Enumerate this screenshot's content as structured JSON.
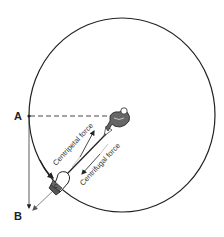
{
  "diagram": {
    "type": "physics-diagram",
    "points": [
      {
        "id": "A",
        "label": "A"
      },
      {
        "id": "B",
        "label": "B"
      }
    ],
    "forces": [
      {
        "id": "centripetal",
        "label": "Centripetal force",
        "direction": "toward-center"
      },
      {
        "id": "centrifugal",
        "label": "Centrifugal force",
        "direction": "away-from-center"
      }
    ],
    "hammer_label": "C",
    "colors": {
      "stroke": "#222222",
      "hammer_fill": "#555555",
      "background": "#ffffff"
    }
  }
}
